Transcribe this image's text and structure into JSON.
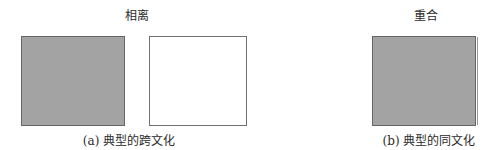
{
  "panel_a": {
    "title": "相离",
    "caption": "(a) 典型的跨文化",
    "shapes": [
      {
        "name": "culture-a-rectangle",
        "fill": "#a3a3a3",
        "border": "#666666"
      },
      {
        "name": "culture-b-rectangle",
        "fill": "#ffffff",
        "border": "#707070"
      }
    ]
  },
  "panel_b": {
    "title": "重合",
    "caption": "(b) 典型的同文化",
    "shapes": [
      {
        "name": "overlapping-rectangle",
        "fill": "#a3a3a3",
        "border": "#666666"
      }
    ]
  }
}
